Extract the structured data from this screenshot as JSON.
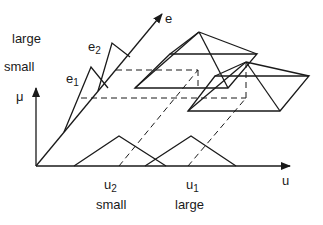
{
  "diagram": {
    "title": "",
    "colors": {
      "line": "#1a1a1a",
      "background": "#ffffff"
    },
    "axes": {
      "mu": {
        "label": "μ",
        "from": [
          36,
          166
        ],
        "to": [
          36,
          88
        ]
      },
      "u": {
        "label": "u",
        "from": [
          36,
          166
        ],
        "to": [
          290,
          166
        ]
      },
      "e": {
        "label": "e",
        "from": [
          36,
          166
        ],
        "to": [
          162,
          14
        ]
      }
    },
    "labels": {
      "e_large": "large",
      "e_small": "small",
      "e1": "e",
      "e1_sub": "1",
      "e2": "e",
      "e2_sub": "2",
      "u2": "u",
      "u2_sub": "2",
      "u1": "u",
      "u1_sub": "1",
      "u_small": "small",
      "u_large": "large",
      "mu": "μ",
      "u_axis": "u",
      "e_axis": "e"
    },
    "u_fuzzy_sets": [
      {
        "name": "small",
        "points": [
          [
            74,
            166
          ],
          [
            119,
            136
          ],
          [
            166,
            166
          ]
        ]
      },
      {
        "name": "large",
        "points": [
          [
            145,
            166
          ],
          [
            191,
            136
          ],
          [
            236,
            166
          ]
        ]
      }
    ],
    "e_fuzzy_sets": [
      {
        "name": "e1",
        "points": [
          [
            64,
            132
          ],
          [
            91,
            67
          ],
          [
            108,
            88
          ]
        ]
      },
      {
        "name": "e2",
        "points": [
          [
            98,
            91
          ],
          [
            112,
            43
          ],
          [
            130,
            57
          ]
        ]
      }
    ],
    "dashed_lines": [
      [
        [
          116,
          70
        ],
        [
          198,
          70
        ]
      ],
      [
        [
          81,
          98
        ],
        [
          246,
          98
        ]
      ],
      [
        [
          198,
          70
        ],
        [
          198,
          88
        ]
      ],
      [
        [
          246,
          62
        ],
        [
          246,
          98
        ]
      ],
      [
        [
          119,
          166
        ],
        [
          198,
          70
        ]
      ],
      [
        [
          188,
          166
        ],
        [
          246,
          98
        ]
      ]
    ],
    "pyramids": [
      {
        "apex": [
          199,
          32
        ],
        "base": [
          [
            170,
            54
          ],
          [
            257,
            54
          ],
          [
            228,
            88
          ],
          [
            135,
            88
          ]
        ]
      },
      {
        "apex": [
          246,
          62
        ],
        "base": [
          [
            215,
            76
          ],
          [
            309,
            76
          ],
          [
            280,
            111
          ],
          [
            188,
            111
          ]
        ]
      }
    ]
  }
}
